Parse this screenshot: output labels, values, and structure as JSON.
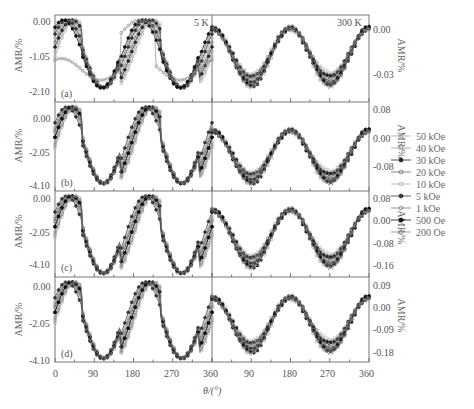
{
  "chart_data": {
    "type": "line",
    "title": "",
    "xlabel": "θ/(°)",
    "ylabel": "AMR/%",
    "left_section_label": "5 K",
    "right_section_label": "300 K",
    "x_ticks_left": [
      "0",
      "90",
      "180",
      "270",
      "360"
    ],
    "x_ticks_right": [
      "90",
      "180",
      "270",
      "360"
    ],
    "xlim_left": [
      0,
      360
    ],
    "xlim_right": [
      0,
      360
    ],
    "legend": [
      "50 kOe",
      "40 kOe",
      "30 kOe",
      "20 kOe",
      "10 kOe",
      "5 kOe",
      "1 kOe",
      "500 Oe",
      "200 Oe"
    ],
    "legend_position": "right",
    "grid": false,
    "panels": [
      {
        "id": "(a)",
        "left_yticks": [
          "0.00",
          "-1.05",
          "-2.10"
        ],
        "left_ylim": [
          -2.3,
          0.1
        ],
        "right_yticks": [
          "0.00",
          "-0.03"
        ],
        "right_ylim": [
          -0.05,
          0.01
        ],
        "left_series_desc": "cos² shape, max 0.00 near 0° and ~205°, min ~-1.8 near 110° and ~300°; one curve (lowest field) starts ~-1.1 with shallower dip",
        "right_series_desc": "sinusoid, max ~0.00 near 180° and 360°, min ~-0.035 near 90° and 270°"
      },
      {
        "id": "(b)",
        "left_yticks": [
          "0.00",
          "-2.05",
          "-4.10"
        ],
        "left_ylim": [
          -4.3,
          0.3
        ],
        "right_yticks": [
          "0.08",
          "0.00",
          "-0.08"
        ],
        "right_ylim": [
          -0.12,
          0.1
        ],
        "left_series_desc": "max ~0.1 near 0° and ~200°, min ~-3.5 near 110° and ~290°; hysteretic shift up to 270° for low fields",
        "right_series_desc": "max ~0.00 near 180° and 360°, min ~-0.08 near 90° and 270°"
      },
      {
        "id": "(c)",
        "left_yticks": [
          "0.00",
          "-2.05",
          "-4.10"
        ],
        "left_ylim": [
          -4.6,
          0.2
        ],
        "right_yticks": [
          "0.08",
          "0.00",
          "-0.08",
          "-0.16"
        ],
        "right_ylim": [
          -0.2,
          0.1
        ],
        "left_series_desc": "max 0.00 near 20° and ~200°, min ~-4.0 near 110° and ~290°; abrupt switching for low fields near 80° and 260°",
        "right_series_desc": "max ~0.00 near 180° and 360°, min ~-0.13 near 90° and 270°"
      },
      {
        "id": "(d)",
        "left_yticks": [
          "0.00",
          "-2.05",
          "-4.10"
        ],
        "left_ylim": [
          -4.6,
          0.2
        ],
        "right_yticks": [
          "0.09",
          "0.00",
          "-0.09",
          "-0.18"
        ],
        "right_ylim": [
          -0.23,
          0.1
        ],
        "left_series_desc": "max 0.00 near 20° and ~200°, min ~-3.9 near 110° and ~290°; abrupt switching near 80° and 265°",
        "right_series_desc": "max ~0.00 near 180° and 360°, min ~-0.17 near 90° and 270°"
      }
    ]
  },
  "labels": {
    "temp_left": "5 K",
    "temp_right": "300 K",
    "xlabel": "θ/(°)",
    "ylabel": "AMR/%",
    "panel_a": "(a)",
    "panel_b": "(b)",
    "panel_c": "(c)",
    "panel_d": "(d)",
    "xt0": "0",
    "xt90": "90",
    "xt180": "180",
    "xt270": "270",
    "xt360": "360",
    "xr90": "90",
    "xr180": "180",
    "xr270": "270",
    "xr360": "360",
    "a_l0": "0.00",
    "a_l1": "-1.05",
    "a_l2": "-2.10",
    "a_r0": "0.00",
    "a_r1": "-0.03",
    "b_l0": "0.00",
    "b_l1": "-2.05",
    "b_l2": "-4.10",
    "b_r0": "0.08",
    "b_r1": "0.00",
    "b_r2": "-0.08",
    "c_l0": "0.00",
    "c_l1": "-2.05",
    "c_l2": "-4.10",
    "c_r0": "0.08",
    "c_r1": "0.00",
    "c_r2": "-0.08",
    "c_r3": "-0.16",
    "d_l0": "0.00",
    "d_l1": "-2.05",
    "d_l2": "-4.10",
    "d_r0": "0.09",
    "d_r1": "0.00",
    "d_r2": "-0.09",
    "d_r3": "-0.18"
  },
  "legend": [
    {
      "label": "50 kOe",
      "marker": "open-circle-light"
    },
    {
      "label": "40 kOe",
      "marker": "open-circle-light"
    },
    {
      "label": "30 kOe",
      "marker": "filled-circle"
    },
    {
      "label": "20 kOe",
      "marker": "open-circle"
    },
    {
      "label": "10 kOe",
      "marker": "open-circle-light"
    },
    {
      "label": "5 kOe",
      "marker": "filled-circle"
    },
    {
      "label": "1 kOe",
      "marker": "open-circle"
    },
    {
      "label": "500 Oe",
      "marker": "filled-circle"
    },
    {
      "label": "200 Oe",
      "marker": "open-circle"
    }
  ]
}
